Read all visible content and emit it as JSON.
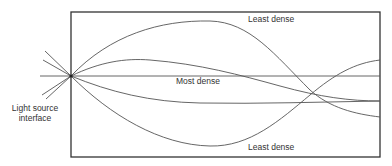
{
  "diagram": {
    "title": "",
    "labels": {
      "light_source": "Light source\ninterface",
      "light_source_line1": "Light source",
      "light_source_line2": "interface",
      "least_dense_top": "Least dense",
      "most_dense": "Most dense",
      "least_dense_bottom": "Least dense"
    },
    "colors": {
      "box_stroke": "#333333",
      "curve_stroke": "#555555",
      "text": "#333333",
      "background": "#ffffff"
    },
    "elements": {
      "box": {
        "x": 71,
        "y": 12,
        "width": 309,
        "height": 145
      },
      "source_point": {
        "x": 71,
        "y": 76
      },
      "axis_line": {
        "x1": 40,
        "x2": 380,
        "y": 76
      },
      "curves": [
        {
          "name": "upper-arc",
          "description": "rises to top near least dense label, descends to lower right"
        },
        {
          "name": "upper-inner",
          "description": "gentle rise then descends to lower right"
        },
        {
          "name": "lower-inner",
          "description": "gentle dip then levels off to right"
        },
        {
          "name": "lower-arc",
          "description": "dips to bottom near least dense label, rises to upper right"
        }
      ],
      "incident_rays": 4
    }
  }
}
